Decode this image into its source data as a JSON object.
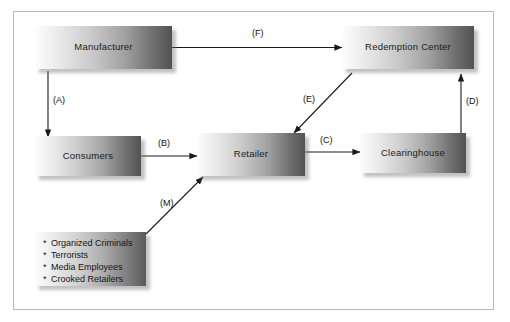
{
  "diagram": {
    "frame": {
      "border_color": "#b9b9b9"
    },
    "nodes": [
      {
        "id": "manufacturer",
        "label": "Manufacturer"
      },
      {
        "id": "redemption-center",
        "label": "Redemption Center"
      },
      {
        "id": "consumers",
        "label": "Consumers"
      },
      {
        "id": "retailer",
        "label": "Retailer"
      },
      {
        "id": "clearinghouse",
        "label": "Clearinghouse"
      }
    ],
    "list_node": {
      "id": "criminals",
      "bullet": "*",
      "items": [
        "Organized Criminals",
        "Terrorists",
        "Media Employees",
        "Crooked Retailers"
      ]
    },
    "connectors": [
      {
        "id": "A",
        "label": "(A)",
        "from": "manufacturer",
        "to": "consumers",
        "style": "single"
      },
      {
        "id": "B",
        "label": "(B)",
        "from": "consumers",
        "to": "retailer",
        "style": "single"
      },
      {
        "id": "C",
        "label": "(C)",
        "from": "retailer",
        "to": "clearinghouse",
        "style": "single"
      },
      {
        "id": "D",
        "label": "(D)",
        "from": "clearinghouse",
        "to": "redemption-center",
        "style": "single"
      },
      {
        "id": "E",
        "label": "(E)",
        "from": "redemption-center",
        "to": "retailer",
        "style": "single"
      },
      {
        "id": "F",
        "label": "(F)",
        "from": "manufacturer",
        "to": "redemption-center",
        "style": "double"
      },
      {
        "id": "M",
        "label": "(M)",
        "from": "criminals",
        "to": "retailer",
        "style": "single"
      }
    ],
    "colors": {
      "arrow": "#1a1a1a",
      "box_light": "#fdfdfd",
      "box_dark": "#525252",
      "text": "#111111"
    }
  }
}
